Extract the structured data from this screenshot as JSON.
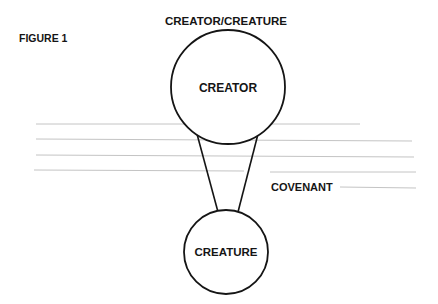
{
  "figure_label": "FIGURE 1",
  "title": "CREATOR/CREATURE",
  "nodes": {
    "creator": {
      "label": "CREATOR"
    },
    "creature": {
      "label": "CREATURE"
    }
  },
  "band": {
    "label": "COVENANT"
  },
  "colors": {
    "ink": "#151515",
    "faint_lines": "#c8c8c8",
    "background": "#ffffff"
  }
}
